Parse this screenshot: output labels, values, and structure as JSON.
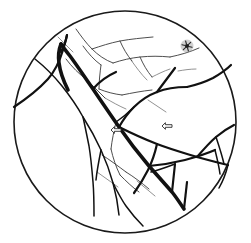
{
  "figure": {
    "title": "Retinal fundus vessel tracing",
    "caption": "",
    "background_color": "#ffffff",
    "line_color": "#111111",
    "field_of_view": {
      "shape": "circle",
      "center_x": 125,
      "center_y": 122,
      "radius": 111,
      "stroke_color": "#1a1a1a",
      "stroke_width": 1.6
    }
  },
  "annotations": [
    {
      "id": "asterisk-marker",
      "type": "asterisk",
      "label": "*",
      "x": 187,
      "y": 46,
      "color": "#1a1a1a",
      "description": "small dark asterisk marker in upper temporal quadrant"
    },
    {
      "id": "arrow-marker-left",
      "type": "arrow-left",
      "label": "<=",
      "x": 116,
      "y": 130,
      "color": "#2a2a2a",
      "description": "outlined left-pointing arrow near central vessel crossing"
    },
    {
      "id": "arrow-marker-right",
      "type": "arrow-left",
      "label": "<=",
      "x": 167,
      "y": 126,
      "color": "#2a2a2a",
      "description": "outlined left-pointing arrow on mid-temporal branch"
    }
  ],
  "vessels": {
    "thick_trunk": [
      "M 61,44 C 63,47 66,51 70,56 C 76,64 84,76 93,89 C 101,101 110,114 119,127 C 128,140 138,153 149,166 C 157,175 165,184 172,192 C 176,197 180,203 184,209",
      "M 61,44 C 59,49 58,56 59,63 C 60,71 63,80 68,90"
    ],
    "major_branches": [
      "M 14,107 C 26,99 38,90 48,79 C 55,71 60,60 63,50 C 65,44 66,39 67,35",
      "M 67,35 C 66,41 64,46 61,52",
      "M 119,127 C 131,133 144,139 157,144 C 170,149 184,153 197,157 C 208,160 219,163 228,165",
      "M 149,166 C 161,165 173,163 185,160 C 196,157 206,154 215,150",
      "M 93,89 C 99,82 107,76 116,72",
      "M 119,127 C 123,120 128,113 134,107 C 141,100 149,95 157,92 C 167,88 177,87 187,87",
      "M 157,92 C 163,84 169,76 175,68",
      "M 187,87 C 196,85 205,82 213,78 C 220,74 226,70 231,65",
      "M 197,157 C 203,150 209,143 216,137 C 222,132 228,128 234,125",
      "M 172,192 C 173,183 174,173 175,164",
      "M 157,144 C 155,153 152,162 148,170 C 144,178 139,186 134,193",
      "M 184,209 C 185,200 186,191 187,182"
    ],
    "medium_branches": [
      "M 35,59 C 45,67 54,76 62,86 C 70,96 77,106 83,117 C 90,128 96,139 101,150 C 106,161 110,172 113,183 C 116,194 118,205 119,215",
      "M 83,117 C 85,126 87,136 89,146 C 91,158 92,170 93,182 C 94,194 94,206 94,216",
      "M 101,150 C 99,160 97,170 96,180",
      "M 113,183 C 117,191 121,199 126,206 C 131,213 137,220 143,226",
      "M 134,107 C 128,113 122,118 116,122",
      "M 216,137 C 219,146 222,155 224,164",
      "M 215,150 C 217,158 219,166 220,174",
      "M 175,164 C 167,167 159,170 151,172",
      "M 228,165 C 226,173 223,181 219,188"
    ],
    "thin_branches": [
      "M 76,29 C 81,36 86,43 92,49 C 98,55 105,60 113,63",
      "M 92,49 C 101,46 110,43 120,41 C 131,39 142,38 153,37",
      "M 113,63 C 122,60 131,58 140,57 C 150,56 160,56 170,57",
      "M 170,57 C 180,55 190,52 199,48",
      "M 83,46 C 88,53 94,60 101,65",
      "M 101,65 C 100,73 99,81 99,89",
      "M 99,89 C 106,92 114,94 122,95",
      "M 122,95 C 132,93 142,91 152,90",
      "M 140,57 C 143,64 147,71 152,77",
      "M 120,41 C 123,48 127,55 132,61",
      "M 66,59 C 72,67 79,74 87,80",
      "M 87,80 C 93,86 99,92 105,98",
      "M 116,122 C 114,131 112,140 111,149",
      "M 111,149 C 113,158 116,167 120,175",
      "M 120,175 C 126,181 132,187 139,192",
      "M 102,155 C 110,160 118,166 126,172",
      "M 126,172 C 134,177 142,183 149,189"
    ],
    "faint_branches": [
      "M 131,60 C 136,67 141,74 147,80",
      "M 152,77 C 158,74 164,71 170,69",
      "M 178,71 C 184,70 190,69 196,69",
      "M 105,98 C 112,102 119,106 126,109",
      "M 58,37 C 63,42 68,47 73,52",
      "M 148,100 C 154,104 160,108 166,112",
      "M 97,172 C 104,177 111,182 118,187",
      "M 137,181 C 143,186 149,191 155,196"
    ]
  }
}
